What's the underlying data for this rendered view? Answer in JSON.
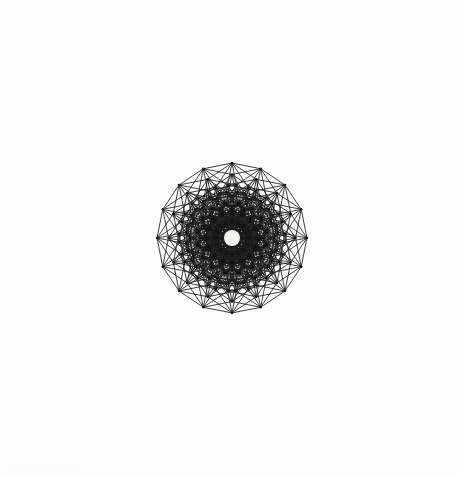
{
  "figure": {
    "subtitle": "Octeract graph drawn in 16-gonal skew projection",
    "caption": "",
    "canvas": {
      "width": 462,
      "height": 477
    },
    "background_color": "#fdfdfd",
    "edge_color": "#1b1b1b",
    "vertex_color": "#111111",
    "center_hole_color": "#f2f2f0"
  },
  "chart_data": {
    "type": "diagram",
    "graph_name": "8-cube (octeract) graph Q8",
    "xlabel": "",
    "ylabel": "",
    "dimension": 8,
    "vertex_count": 256,
    "edge_count": 1024,
    "degree": 8,
    "symmetry_order": 16,
    "petrie_polygon_sides": 16,
    "outer_ring_vertices": 16,
    "concentric_ring_count": 9,
    "ring_vertex_counts": [
      1,
      8,
      28,
      56,
      70,
      56,
      28,
      8,
      1
    ],
    "projection": {
      "center_x": 232,
      "center_y": 238,
      "outer_radius": 212,
      "rotation_degrees": 11.25,
      "basis_angles_degrees": [
        0,
        22.5,
        45,
        67.5,
        90,
        112.5,
        135,
        157.5
      ],
      "basis_scale_decay": 1.0
    },
    "render": {
      "edge_stroke_width": 0.85,
      "vertex_radius": 1.25,
      "center_hole_radius": 8,
      "grid": false,
      "legend": false,
      "axes": false
    },
    "legend_entries": [],
    "annotations": []
  }
}
